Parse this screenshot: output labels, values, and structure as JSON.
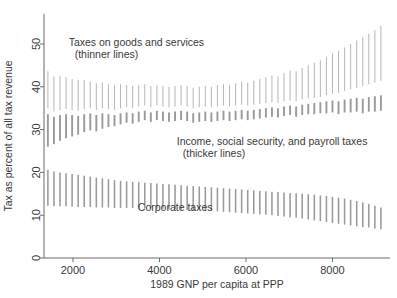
{
  "chart_data": {
    "type": "line",
    "title": "",
    "subtitle": "",
    "xlabel": "1989 GNP per capita at PPP",
    "ylabel": "Tax as percent of all tax revenue",
    "xlim": [
      1330,
      9330
    ],
    "ylim": [
      0,
      57
    ],
    "xticks": [
      2000,
      4000,
      6000,
      8000
    ],
    "xticklabels": [
      "2000",
      "4000",
      "6000",
      "8000"
    ],
    "yticks": [
      0,
      10,
      20,
      30,
      40,
      50
    ],
    "yticklabels": [
      "0",
      "10",
      "20",
      "30",
      "40",
      "50"
    ],
    "grid": false,
    "legend_position": "inline-annotations",
    "annotations": [
      {
        "id": "goods",
        "text_line1": "Taxes on goods and services",
        "text_line2": "(thinner lines)",
        "x": 1900,
        "y": 49.5
      },
      {
        "id": "income",
        "text_line1": "Income, social security, and payroll taxes",
        "text_line2": "(thicker lines)",
        "x": 4400,
        "y": 26.5
      },
      {
        "id": "corporate",
        "text_line1": "Corporate taxes",
        "text_line2": "",
        "x": 3500,
        "y": 11.0
      }
    ],
    "series": [
      {
        "name": "Taxes on goods and services",
        "style": "thin vertical interval bars",
        "color": "#b9b9b9",
        "linewidth": 1.05,
        "x": [
          1420,
          1560,
          1700,
          1840,
          1980,
          2120,
          2260,
          2400,
          2540,
          2680,
          2820,
          2960,
          3100,
          3240,
          3380,
          3520,
          3660,
          3800,
          3940,
          4080,
          4220,
          4360,
          4500,
          4640,
          4780,
          4920,
          5060,
          5200,
          5340,
          5480,
          5620,
          5760,
          5900,
          6040,
          6180,
          6320,
          6460,
          6600,
          6740,
          6880,
          7020,
          7160,
          7300,
          7440,
          7580,
          7720,
          7860,
          8000,
          8140,
          8280,
          8420,
          8560,
          8700,
          8840,
          8980,
          9120
        ],
        "lower": [
          35.0,
          34.2,
          34.6,
          34.8,
          34.6,
          34.4,
          34.8,
          35.0,
          34.6,
          35.0,
          34.8,
          34.6,
          35.0,
          35.2,
          35.0,
          35.4,
          35.6,
          35.2,
          35.6,
          35.4,
          35.2,
          35.4,
          35.6,
          35.4,
          35.0,
          35.2,
          35.4,
          35.2,
          35.4,
          35.6,
          35.4,
          35.6,
          35.8,
          35.6,
          35.8,
          36.0,
          36.2,
          36.4,
          36.2,
          36.6,
          36.8,
          36.6,
          37.0,
          37.2,
          37.4,
          37.6,
          38.0,
          38.4,
          38.6,
          39.0,
          39.4,
          39.8,
          40.2,
          40.6,
          41.0,
          41.4
        ],
        "upper": [
          43.6,
          42.4,
          42.6,
          42.2,
          41.8,
          41.6,
          41.6,
          41.2,
          40.8,
          41.0,
          40.6,
          40.4,
          40.6,
          40.4,
          40.2,
          40.4,
          40.6,
          40.2,
          40.4,
          40.2,
          40.0,
          40.2,
          40.4,
          40.2,
          39.8,
          40.0,
          40.2,
          40.0,
          40.4,
          40.6,
          40.4,
          40.8,
          41.2,
          41.0,
          41.4,
          41.8,
          42.2,
          42.6,
          42.4,
          43.2,
          43.8,
          43.6,
          44.4,
          45.0,
          45.6,
          46.2,
          47.0,
          47.8,
          48.4,
          49.2,
          50.0,
          50.8,
          51.6,
          52.4,
          53.2,
          54.2
        ]
      },
      {
        "name": "Income, social security, and payroll taxes",
        "style": "thick vertical interval bars",
        "color": "#9a9a9a",
        "linewidth": 1.9,
        "x": [
          1420,
          1560,
          1700,
          1840,
          1980,
          2120,
          2260,
          2400,
          2540,
          2680,
          2820,
          2960,
          3100,
          3240,
          3380,
          3520,
          3660,
          3800,
          3940,
          4080,
          4220,
          4360,
          4500,
          4640,
          4780,
          4920,
          5060,
          5200,
          5340,
          5480,
          5620,
          5760,
          5900,
          6040,
          6180,
          6320,
          6460,
          6600,
          6740,
          6880,
          7020,
          7160,
          7300,
          7440,
          7580,
          7720,
          7860,
          8000,
          8140,
          8280,
          8420,
          8560,
          8700,
          8840,
          8980,
          9120
        ],
        "lower": [
          33.6,
          33.0,
          33.4,
          33.6,
          33.4,
          33.2,
          33.6,
          33.8,
          33.4,
          33.8,
          33.6,
          33.4,
          33.8,
          34.0,
          33.8,
          34.2,
          34.4,
          34.0,
          34.4,
          34.2,
          34.0,
          34.2,
          34.4,
          34.2,
          33.8,
          34.0,
          34.2,
          34.0,
          34.2,
          34.4,
          34.2,
          34.4,
          34.6,
          34.4,
          34.6,
          34.8,
          35.0,
          35.2,
          35.0,
          35.4,
          35.6,
          35.4,
          35.8,
          36.0,
          36.2,
          36.4,
          36.6,
          36.8,
          36.6,
          37.0,
          37.2,
          37.4,
          37.2,
          37.6,
          37.8,
          38.0
        ],
        "upper": [
          26.0,
          26.6,
          27.4,
          28.0,
          28.4,
          28.8,
          29.4,
          29.8,
          29.6,
          30.2,
          30.6,
          30.8,
          31.2,
          31.6,
          31.4,
          31.8,
          32.2,
          31.8,
          32.2,
          32.0,
          31.8,
          32.0,
          32.2,
          32.0,
          31.6,
          31.8,
          32.0,
          31.8,
          32.0,
          32.2,
          32.0,
          32.2,
          32.4,
          32.2,
          32.4,
          32.6,
          32.8,
          33.0,
          32.8,
          33.2,
          33.4,
          33.0,
          33.4,
          33.6,
          33.6,
          33.8,
          33.8,
          34.0,
          33.6,
          34.0,
          34.0,
          34.2,
          33.8,
          34.2,
          34.2,
          34.4
        ]
      },
      {
        "name": "Corporate taxes",
        "style": "medium vertical interval bars",
        "color": "#9a9a9a",
        "linewidth": 1.55,
        "x": [
          1420,
          1560,
          1700,
          1840,
          1980,
          2120,
          2260,
          2400,
          2540,
          2680,
          2820,
          2960,
          3100,
          3240,
          3380,
          3520,
          3660,
          3800,
          3940,
          4080,
          4220,
          4360,
          4500,
          4640,
          4780,
          4920,
          5060,
          5200,
          5340,
          5480,
          5620,
          5760,
          5900,
          6040,
          6180,
          6320,
          6460,
          6600,
          6740,
          6880,
          7020,
          7160,
          7300,
          7440,
          7580,
          7720,
          7860,
          8000,
          8140,
          8280,
          8420,
          8560,
          8700,
          8840,
          8980,
          9120
        ],
        "lower": [
          12.2,
          12.1,
          12.1,
          12.1,
          12.0,
          11.9,
          11.9,
          11.9,
          11.8,
          11.8,
          11.8,
          11.7,
          11.7,
          11.7,
          11.7,
          11.6,
          11.6,
          11.6,
          11.5,
          11.5,
          11.4,
          11.4,
          11.3,
          11.2,
          11.2,
          11.1,
          11.0,
          11.0,
          10.9,
          10.8,
          10.7,
          10.6,
          10.5,
          10.4,
          10.3,
          10.2,
          10.1,
          10.0,
          9.8,
          9.7,
          9.5,
          9.4,
          9.2,
          9.0,
          8.8,
          8.6,
          8.4,
          8.2,
          8.0,
          7.8,
          7.6,
          7.4,
          7.2,
          7.1,
          6.9,
          6.7
        ],
        "upper": [
          20.6,
          20.2,
          20.0,
          19.8,
          19.6,
          19.4,
          19.2,
          19.0,
          18.8,
          18.6,
          18.4,
          18.2,
          18.0,
          17.9,
          17.8,
          17.7,
          17.6,
          17.5,
          17.4,
          17.3,
          17.2,
          17.1,
          17.0,
          16.9,
          16.8,
          16.7,
          16.6,
          16.5,
          16.4,
          16.3,
          16.2,
          16.1,
          16.0,
          15.9,
          15.8,
          15.7,
          15.6,
          15.5,
          15.4,
          15.3,
          15.2,
          15.1,
          15.0,
          14.9,
          14.8,
          14.6,
          14.5,
          14.3,
          14.1,
          13.9,
          13.6,
          13.3,
          13.0,
          12.6,
          12.2,
          11.8
        ]
      }
    ]
  }
}
